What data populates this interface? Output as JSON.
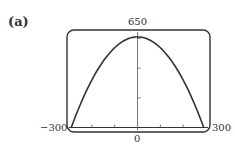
{
  "panel_label": "(a)",
  "chart_data": {
    "type": "line",
    "title": "",
    "xlabel": "",
    "ylabel": "",
    "xlim": [
      -300,
      300
    ],
    "ylim": [
      0,
      650
    ],
    "grid": false,
    "legend": null,
    "tick_labels": {
      "xmin": "−300",
      "xmax": "300",
      "x_origin": "0",
      "ymax": "650"
    },
    "x_ticks": [
      -200,
      -100,
      0,
      100,
      200
    ],
    "y_ticks": [
      200,
      400,
      600
    ],
    "series": [
      {
        "name": "parabola",
        "description": "Downward-opening parabola, roots near x=−290 and x=290, vertex near (0, 610)",
        "x": [
          -290,
          -250,
          -200,
          -150,
          -100,
          -50,
          0,
          50,
          100,
          150,
          200,
          250,
          290
        ],
        "y": [
          0,
          157,
          320,
          447,
          537,
          592,
          610,
          592,
          537,
          447,
          320,
          157,
          0
        ]
      }
    ]
  }
}
